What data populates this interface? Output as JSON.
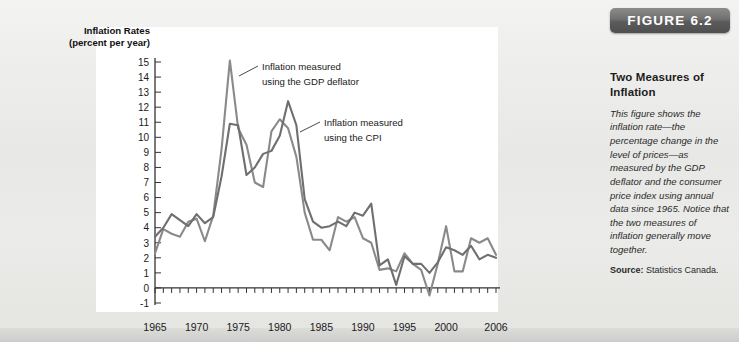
{
  "figure": {
    "badge_label": "FIGURE 6.2",
    "title": "Two Measures of Inflation",
    "description": "This figure shows the inflation rate—the percentage change in the level of prices—as measured by the GDP deflator and the consumer price index using annual data since 1965. Notice that the two measures of inflation generally move together.",
    "source_label": "Source:",
    "source_text": "Statistics Canada."
  },
  "chart_data": {
    "type": "line",
    "title": "",
    "ylabel_line1": "Inflation Rates",
    "ylabel_line2": "(percent per year)",
    "xlabel": "",
    "ylim": [
      -1,
      15
    ],
    "xlim": [
      1965,
      2006
    ],
    "grid": false,
    "legend_position": "inline-annotations",
    "ytick_labels": [
      "15",
      "14",
      "13",
      "12",
      "11",
      "10",
      "9",
      "8",
      "7",
      "6",
      "5",
      "4",
      "3",
      "2",
      "1",
      "0",
      "-1"
    ],
    "ytick_values": [
      15,
      14,
      13,
      12,
      11,
      10,
      9,
      8,
      7,
      6,
      5,
      4,
      3,
      2,
      1,
      0,
      -1
    ],
    "xtick_labels": [
      "1965",
      "1970",
      "1975",
      "1980",
      "1985",
      "1990",
      "1995",
      "2000",
      "2006"
    ],
    "xtick_values": [
      1965,
      1970,
      1975,
      1980,
      1985,
      1990,
      1995,
      2000,
      2006
    ],
    "annotations": [
      {
        "id": "gdp-deflator-annotation",
        "text_line1": "Inflation measured",
        "text_line2": "using the GDP deflator"
      },
      {
        "id": "cpi-annotation",
        "text_line1": "Inflation measured",
        "text_line2": "using the CPI"
      }
    ],
    "x": [
      1965,
      1966,
      1967,
      1968,
      1969,
      1970,
      1971,
      1972,
      1973,
      1974,
      1975,
      1976,
      1977,
      1978,
      1979,
      1980,
      1981,
      1982,
      1983,
      1984,
      1985,
      1986,
      1987,
      1988,
      1989,
      1990,
      1991,
      1992,
      1993,
      1994,
      1995,
      1996,
      1997,
      1998,
      1999,
      2000,
      2001,
      2002,
      2003,
      2004,
      2005,
      2006
    ],
    "series": [
      {
        "name": "Inflation measured using the GDP deflator",
        "color": "#8a8a8a",
        "values": [
          2.3,
          3.9,
          3.6,
          3.4,
          4.4,
          4.6,
          3.1,
          4.8,
          9.2,
          15.1,
          10.6,
          9.5,
          7.0,
          6.7,
          10.4,
          11.2,
          10.6,
          8.7,
          5.0,
          3.2,
          3.2,
          2.5,
          4.7,
          4.4,
          4.7,
          3.3,
          3.0,
          1.2,
          1.3,
          1.1,
          2.3,
          1.6,
          1.2,
          -0.5,
          1.6,
          4.1,
          1.1,
          1.1,
          3.3,
          3.0,
          3.3,
          2.2
        ]
      },
      {
        "name": "Inflation measured using the CPI",
        "color": "#6f6f6f",
        "values": [
          3.4,
          4.0,
          4.9,
          4.5,
          4.1,
          4.9,
          4.3,
          4.7,
          7.4,
          10.9,
          10.8,
          7.5,
          8.0,
          8.9,
          9.1,
          10.1,
          12.4,
          10.8,
          5.9,
          4.4,
          4.0,
          4.1,
          4.4,
          4.1,
          5.0,
          4.8,
          5.6,
          1.5,
          1.9,
          0.2,
          2.1,
          1.6,
          1.6,
          1.0,
          1.7,
          2.7,
          2.5,
          2.2,
          2.8,
          1.9,
          2.2,
          2.0
        ]
      }
    ]
  }
}
